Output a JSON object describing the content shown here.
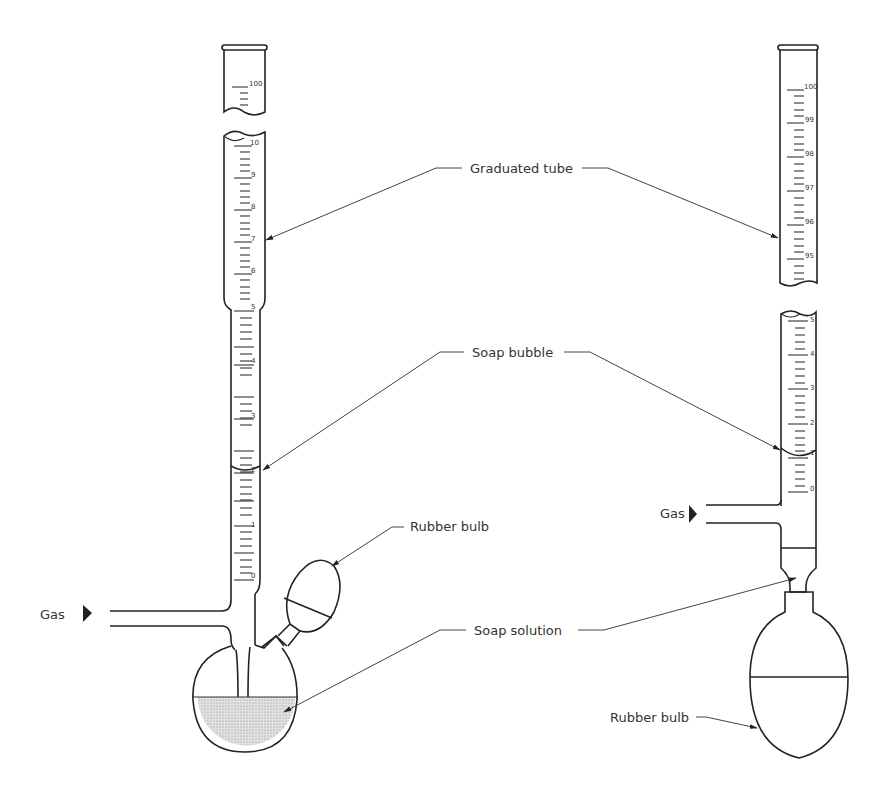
{
  "diagram": {
    "labels": {
      "graduated_tube": "Graduated tube",
      "soap_bubble": "Soap bubble",
      "rubber_bulb_left": "Rubber bulb",
      "rubber_bulb_right": "Rubber bulb",
      "soap_solution": "Soap solution",
      "gas_left": "Gas",
      "gas_right": "Gas"
    },
    "left_apparatus": {
      "top_segment_scale": [
        "100"
      ],
      "upper_scale": [
        "10",
        "9",
        "8",
        "7",
        "6"
      ],
      "lower_scale": [
        "5",
        "4",
        "3",
        "2",
        "1",
        "0"
      ]
    },
    "right_apparatus": {
      "upper_scale": [
        "100",
        "99",
        "98",
        "97",
        "96",
        "95"
      ],
      "lower_scale": [
        "5",
        "4",
        "3",
        "2",
        "1",
        "0"
      ]
    },
    "colors": {
      "line": "#222222",
      "fill_solution": "#d8d8d8"
    }
  }
}
